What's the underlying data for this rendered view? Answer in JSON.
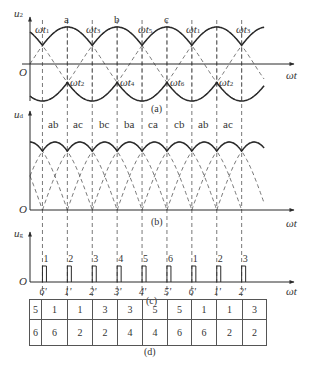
{
  "panels": {
    "a": {
      "caption": "(a)",
      "y_axis_label": "u",
      "y_axis_sub": "2",
      "x_axis_label": "ωt",
      "origin_label": "O",
      "peak_labels": [
        "a",
        "b",
        "c"
      ],
      "top_crossings": [
        {
          "label": "ωt",
          "sub": "1"
        },
        {
          "label": "ωt",
          "sub": "3"
        },
        {
          "label": "ωt",
          "sub": "5"
        },
        {
          "label": "ωt",
          "sub": "1"
        },
        {
          "label": "ωt",
          "sub": "3"
        }
      ],
      "bottom_crossings": [
        {
          "label": "ωt",
          "sub": "2"
        },
        {
          "label": "ωt",
          "sub": "4"
        },
        {
          "label": "ωt",
          "sub": "6"
        },
        {
          "label": "ωt",
          "sub": "2"
        }
      ]
    },
    "b": {
      "caption": "(b)",
      "y_axis_label": "u",
      "y_axis_sub": "d",
      "x_axis_label": "ωt",
      "origin_label": "O",
      "segment_labels": [
        "ab",
        "ac",
        "bc",
        "ba",
        "ca",
        "cb",
        "ab",
        "ac"
      ]
    },
    "c": {
      "caption": "(c)",
      "y_axis_label": "u",
      "y_axis_sub": "g",
      "x_axis_label": "ωt",
      "origin_label": "O",
      "pulse_top_labels": [
        "1",
        "2",
        "3",
        "4",
        "5",
        "6",
        "1",
        "2",
        "3"
      ],
      "pulse_bottom_labels": [
        "6'",
        "1'",
        "2'",
        "3'",
        "4'",
        "5'",
        "6'",
        "1'",
        "2'"
      ]
    },
    "d": {
      "caption": "(d)",
      "rows": [
        [
          "5",
          "1",
          "1",
          "3",
          "3",
          "5",
          "5",
          "1",
          "1",
          "3"
        ],
        [
          "6",
          "6",
          "2",
          "2",
          "4",
          "4",
          "6",
          "6",
          "2",
          "2"
        ]
      ]
    }
  },
  "colors": {
    "line": "#2a2a2a",
    "dashed": "#555555",
    "background": "#ffffff"
  }
}
